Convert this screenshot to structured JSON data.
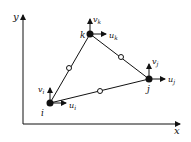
{
  "diagram": {
    "axes": {
      "x_label": "x",
      "y_label": "y"
    },
    "nodes": [
      {
        "id": "i",
        "label": "i",
        "u": "u",
        "u_sub": "i",
        "v": "v",
        "v_sub": "i"
      },
      {
        "id": "j",
        "label": "j",
        "u": "u",
        "u_sub": "j",
        "v": "v",
        "v_sub": "j"
      },
      {
        "id": "k",
        "label": "k",
        "u": "u",
        "u_sub": "k",
        "v": "v",
        "v_sub": "k"
      }
    ],
    "midside_nodes": 3
  }
}
